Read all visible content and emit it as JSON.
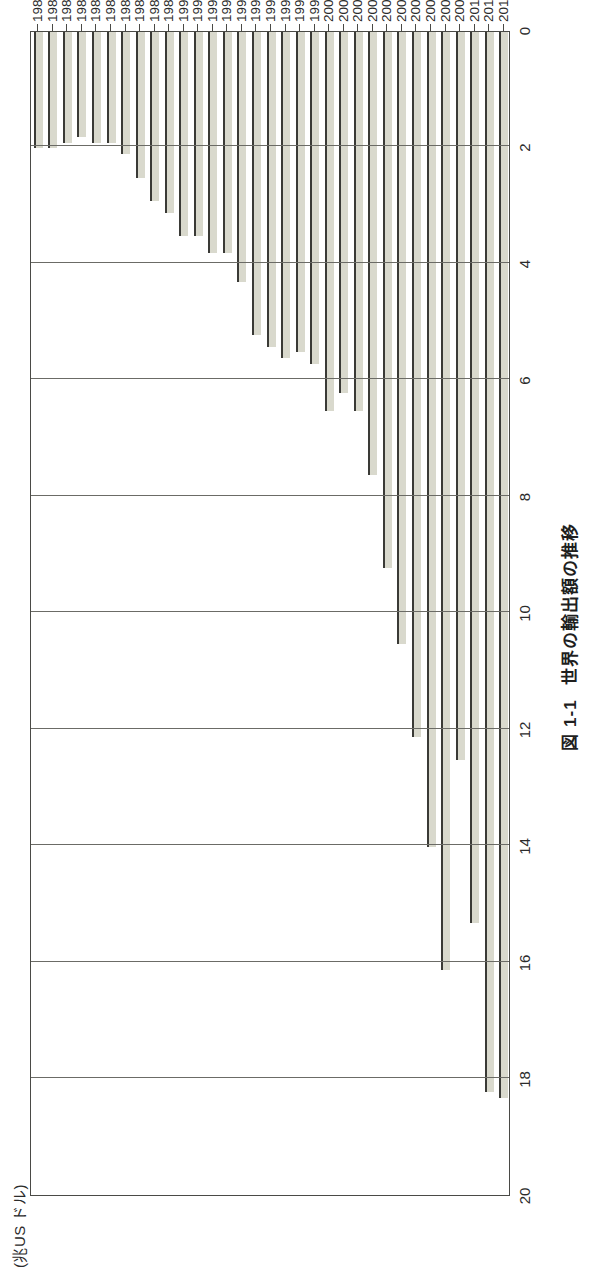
{
  "figure": {
    "number_label": "図 1-1",
    "caption": "世界の輸出額の推移",
    "unit_label": "(兆US ドル)"
  },
  "chart_data": {
    "type": "bar",
    "orientation": "horizontal-rotated",
    "xlabel": "",
    "ylabel": "(兆US ドル)",
    "ylim": [
      0,
      20
    ],
    "ytick_step": 2,
    "ytick_labels": [
      "20",
      "18",
      "16",
      "14",
      "12",
      "10",
      "8",
      "6",
      "4",
      "2",
      "0"
    ],
    "grid": true,
    "legend": false,
    "series_name": "世界の輸出額",
    "categories": [
      "1980",
      "1981",
      "1982",
      "1983",
      "1984",
      "1985",
      "1986",
      "1987",
      "1988",
      "1989",
      "1990",
      "1991",
      "1992",
      "1993",
      "1994",
      "1995",
      "1996",
      "1997",
      "1998",
      "1999",
      "2000",
      "2001",
      "2002",
      "2003",
      "2004",
      "2005",
      "2006",
      "2007",
      "2008",
      "2009",
      "2010",
      "2011",
      "2012"
    ],
    "values": [
      2.0,
      2.0,
      1.9,
      1.8,
      1.9,
      1.9,
      2.1,
      2.5,
      2.9,
      3.1,
      3.5,
      3.5,
      3.8,
      3.8,
      4.3,
      5.2,
      5.4,
      5.6,
      5.5,
      5.7,
      6.5,
      6.2,
      6.5,
      7.6,
      9.2,
      10.5,
      12.1,
      14.0,
      16.1,
      12.5,
      15.3,
      18.2,
      18.3
    ],
    "value_unit": "trillion USD"
  }
}
